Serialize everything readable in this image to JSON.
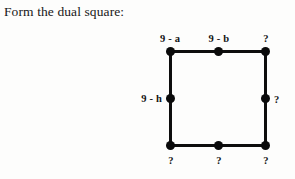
{
  "prompt": {
    "text": "Form the dual square:"
  },
  "figure": {
    "name": "dual-square-diagram",
    "square": {
      "left": 170,
      "top": 51,
      "right": 265,
      "bottom": 145,
      "stroke_color": "#0d0d0d",
      "stroke_width": 3
    },
    "vertex_color": "#0a0a0a",
    "vertices": [
      {
        "id": "top-left",
        "x": 170,
        "y": 51
      },
      {
        "id": "top-middle",
        "x": 218,
        "y": 51
      },
      {
        "id": "top-right",
        "x": 265,
        "y": 51
      },
      {
        "id": "middle-left",
        "x": 170,
        "y": 98
      },
      {
        "id": "middle-right",
        "x": 265,
        "y": 98
      },
      {
        "id": "bottom-left",
        "x": 170,
        "y": 145
      },
      {
        "id": "bottom-middle",
        "x": 218,
        "y": 145
      },
      {
        "id": "bottom-right",
        "x": 265,
        "y": 145
      }
    ],
    "labels": [
      {
        "id": "label-top-left",
        "text": "9 - a",
        "x": 170,
        "y": 44,
        "position": "top"
      },
      {
        "id": "label-top-middle",
        "text": "9 - b",
        "x": 219,
        "y": 44,
        "position": "top"
      },
      {
        "id": "label-top-right",
        "text": "?",
        "x": 266,
        "y": 44,
        "position": "top"
      },
      {
        "id": "label-middle-left",
        "text": "9 - h",
        "x": 162,
        "y": 98,
        "position": "left"
      },
      {
        "id": "label-middle-right",
        "text": "?",
        "x": 274,
        "y": 99,
        "position": "right"
      },
      {
        "id": "label-bottom-left",
        "text": "?",
        "x": 171,
        "y": 155,
        "position": "bottom"
      },
      {
        "id": "label-bottom-middle",
        "text": "?",
        "x": 219,
        "y": 155,
        "position": "bottom"
      },
      {
        "id": "label-bottom-right",
        "text": "?",
        "x": 266,
        "y": 155,
        "position": "bottom"
      }
    ]
  }
}
